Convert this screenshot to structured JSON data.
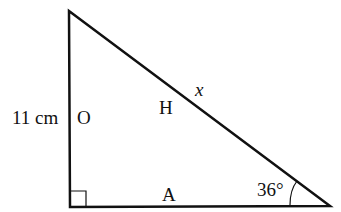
{
  "diagram": {
    "type": "right-triangle",
    "stroke_color": "#111111",
    "background": "#ffffff",
    "vertices": {
      "top": [
        69,
        11
      ],
      "bottom_left": [
        70,
        207
      ],
      "bottom_right": [
        330,
        206
      ]
    },
    "right_angle_marker": "bottom_left",
    "labels": {
      "side_length": "11 cm",
      "opposite": "O",
      "hypotenuse": "H",
      "unknown": "x",
      "adjacent": "A",
      "angle": "36°"
    }
  }
}
